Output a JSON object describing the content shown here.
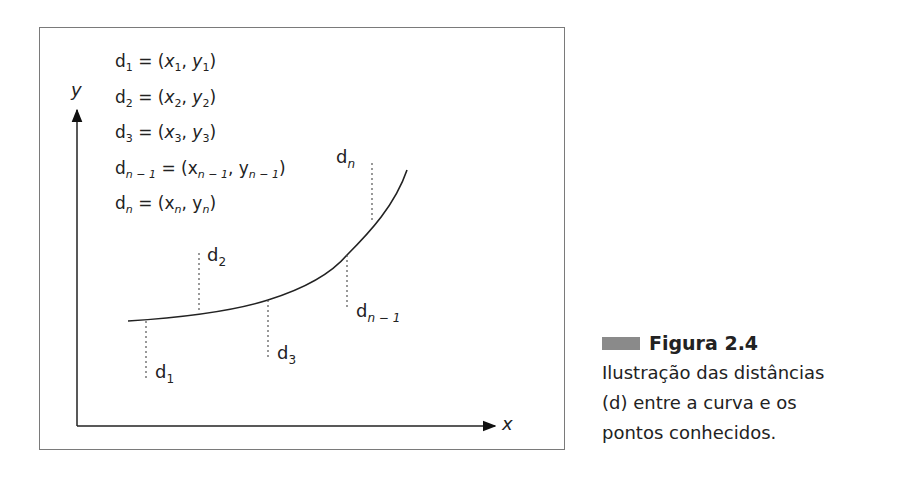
{
  "figure": {
    "number_label": "Figura 2.4",
    "caption_lines": [
      "Ilustração das distâncias",
      "(d) entre a curva e os",
      "pontos conhecidos."
    ],
    "swatch_color": "#8a8a8a"
  },
  "axes": {
    "x_label": "x",
    "y_label": "y"
  },
  "equations": [
    {
      "d": "d",
      "d_sub": "1",
      "x": "x",
      "x_sub": "1",
      "y": "y",
      "y_sub": "1"
    },
    {
      "d": "d",
      "d_sub": "2",
      "x": "x",
      "x_sub": "2",
      "y": "y",
      "y_sub": "2"
    },
    {
      "d": "d",
      "d_sub": "3",
      "x": "x",
      "x_sub": "3",
      "y": "y",
      "y_sub": "3"
    },
    {
      "d": "d",
      "d_sub": "n − 1",
      "x": "x",
      "x_sub": "n − 1",
      "y": "y",
      "y_sub": "n − 1"
    },
    {
      "d": "d",
      "d_sub": "n",
      "x": "x",
      "x_sub": "n",
      "y": "y",
      "y_sub": "n"
    }
  ],
  "distance_labels": [
    {
      "base": "d",
      "sub": "1"
    },
    {
      "base": "d",
      "sub": "2"
    },
    {
      "base": "d",
      "sub": "3"
    },
    {
      "base": "d",
      "sub": "n − 1"
    },
    {
      "base": "d",
      "sub": "n"
    }
  ],
  "eq_text": {
    "equals_open": " = (",
    "comma": ", ",
    "close": ")"
  }
}
